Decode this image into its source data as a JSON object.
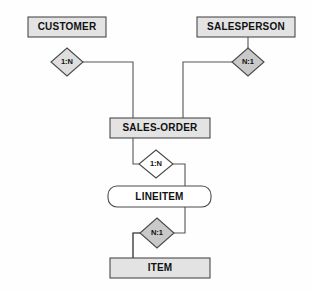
{
  "diagram": {
    "type": "entity-relationship-diagram",
    "background_color": "#fefefe",
    "line_color": "#555555",
    "entities": [
      {
        "id": "customer",
        "label": "CUSTOMER",
        "shape": "rectangle",
        "fill": "#e3e3e3",
        "x": 28,
        "y": 17,
        "w": 78,
        "h": 20
      },
      {
        "id": "salesperson",
        "label": "SALESPERSON",
        "shape": "rectangle",
        "fill": "#e3e3e3",
        "x": 197,
        "y": 17,
        "w": 98,
        "h": 20
      },
      {
        "id": "sales-order",
        "label": "SALES-ORDER",
        "shape": "rectangle",
        "fill": "#e3e3e3",
        "x": 110,
        "y": 118,
        "w": 100,
        "h": 20
      },
      {
        "id": "lineitem",
        "label": "LINEITEM",
        "shape": "rounded-rectangle",
        "fill": "#ffffff",
        "x": 108,
        "y": 186,
        "w": 103,
        "h": 21
      },
      {
        "id": "item",
        "label": "ITEM",
        "shape": "rectangle",
        "fill": "#e3e3e3",
        "x": 110,
        "y": 258,
        "w": 100,
        "h": 20
      }
    ],
    "relationships": [
      {
        "id": "customer-salesorder",
        "label": "1:N",
        "shape": "diamond",
        "fill": "#dedede",
        "from": "customer",
        "to": "sales-order",
        "cx": 67,
        "cy": 62,
        "rx": 16,
        "ry": 14
      },
      {
        "id": "salesperson-salesorder",
        "label": "N:1",
        "shape": "diamond",
        "fill": "#c9c9c9",
        "from": "salesperson",
        "to": "sales-order",
        "cx": 248,
        "cy": 62,
        "rx": 16,
        "ry": 14
      },
      {
        "id": "salesorder-lineitem",
        "label": "1:N",
        "shape": "diamond",
        "fill": "#ffffff",
        "from": "sales-order",
        "to": "lineitem",
        "cx": 156,
        "cy": 164,
        "rx": 17,
        "ry": 14
      },
      {
        "id": "lineitem-item",
        "label": "N:1",
        "shape": "diamond",
        "fill": "#c9c9c9",
        "from": "lineitem",
        "to": "item",
        "cx": 157,
        "cy": 233,
        "rx": 17,
        "ry": 15
      }
    ],
    "connectors": [
      {
        "id": "customer-to-rel1",
        "path": "M 67,37 L 67,48"
      },
      {
        "id": "rel1-to-salesorder",
        "path": "M 83,62 L 133,62 L 133,118"
      },
      {
        "id": "salesperson-to-rel2",
        "path": "M 248,37 L 248,48"
      },
      {
        "id": "rel2-to-salesorder",
        "path": "M 232,62 L 183,62 L 183,118"
      },
      {
        "id": "salesorder-to-rel3",
        "path": "M 133,138 L 133,164 L 139,164"
      },
      {
        "id": "rel3-to-lineitem",
        "path": "M 173,164 L 185,164 L 185,186"
      },
      {
        "id": "lineitem-to-rel4",
        "path": "M 185,207 L 185,233 L 174,233"
      },
      {
        "id": "rel4-to-item",
        "path": "M 140,233 L 133,233 L 133,258"
      }
    ]
  }
}
